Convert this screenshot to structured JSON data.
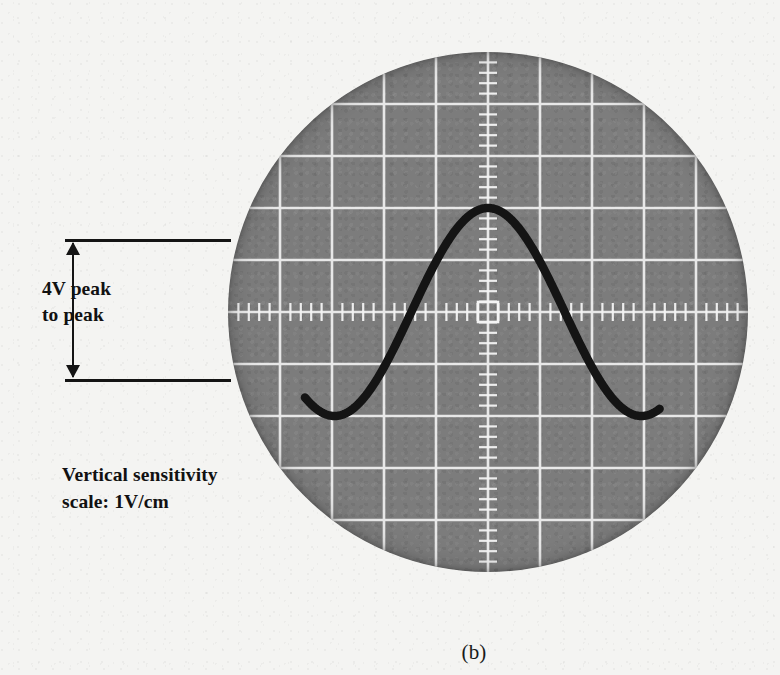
{
  "figure": {
    "caption": "(b)",
    "background_color": "#f4f4f2"
  },
  "annotations": {
    "peak_to_peak": {
      "line1": "4V peak",
      "line2": "to peak",
      "value_volts": 4,
      "arrow_top_y": 239,
      "arrow_bottom_y": 379
    },
    "sensitivity": {
      "line1": "Vertical sensitivity",
      "line2": "scale:  1V/cm",
      "volts_per_div": 1,
      "unit": "V/cm"
    }
  },
  "crt": {
    "screen_color": "#7d7d7d",
    "graticule_color": "#f0f0f0",
    "trace_color": "#141414",
    "diameter_px": 520,
    "center_x": 260,
    "center_y": 260,
    "division_px": 52,
    "divisions_x": 10,
    "divisions_y": 10,
    "minor_ticks_per_division": 5,
    "center_marker": "square"
  },
  "chart_data": {
    "type": "line",
    "xlabel": "Time (divisions)",
    "ylabel": "Voltage (V)",
    "xlim": [
      -5,
      5
    ],
    "ylim": [
      -5,
      5
    ],
    "grid": true,
    "legend": "none",
    "volts_per_division": 1,
    "waveform": {
      "shape": "sine",
      "amplitude_divisions": 2,
      "amplitude_volts": 2,
      "peak_to_peak_volts": 4,
      "period_divisions": 5.9,
      "cycles_visible": 2.5,
      "phase_deg": 0,
      "dc_offset_volts": 0,
      "trace_start_x_div": -3.52,
      "trace_end_x_div": 3.3
    },
    "series": [
      {
        "name": "Vin",
        "x": [
          -3.52,
          -3.2,
          -2.9,
          -2.6,
          -2.3,
          -2.0,
          -1.7,
          -1.4,
          -1.1,
          -0.8,
          -0.5,
          -0.2,
          0.0,
          0.2,
          0.5,
          0.8,
          1.1,
          1.4,
          1.7,
          2.0,
          2.3,
          2.6,
          2.9,
          3.3
        ],
        "y": [
          0.55,
          1.25,
          1.78,
          1.99,
          1.84,
          1.32,
          0.55,
          -0.35,
          -1.2,
          -1.8,
          -2.0,
          -1.78,
          -1.55,
          0.0,
          1.45,
          1.95,
          1.72,
          1.05,
          0.1,
          -0.9,
          -1.68,
          -2.0,
          -1.72,
          0.1
        ]
      }
    ],
    "annotations": [
      {
        "text": "4V peak to peak",
        "type": "span-arrow",
        "y_range_volts": [
          -2,
          2
        ]
      },
      {
        "text": "Vertical sensitivity scale: 1V/cm",
        "type": "note"
      }
    ]
  }
}
